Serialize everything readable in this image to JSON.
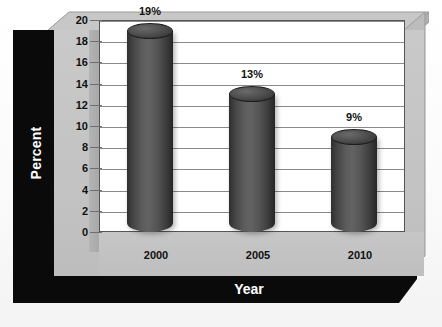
{
  "chart_data": {
    "type": "bar",
    "title": "",
    "subtitle": "",
    "xlabel": "Year",
    "ylabel": "Percent",
    "categories": [
      "2000",
      "2005",
      "2010"
    ],
    "values": [
      19,
      13,
      9
    ],
    "data_labels": [
      "19%",
      "13%",
      "9%"
    ],
    "ylim": [
      0,
      20
    ],
    "ytick_labels": [
      "0",
      "2",
      "4",
      "6",
      "8",
      "10",
      "12",
      "14",
      "16",
      "18",
      "20"
    ],
    "ytick_values": [
      0,
      2,
      4,
      6,
      8,
      10,
      12,
      14,
      16,
      18,
      20
    ],
    "grid": true,
    "grid_axis": "y",
    "legend": false,
    "legend_position": "none",
    "style": "3d-cylinder",
    "series": [
      {
        "name": "Percent",
        "values": [
          19,
          13,
          9
        ]
      }
    ],
    "colors": {
      "bar_fill": "#535353",
      "bar_edge": "#1d1d1d",
      "plot_background": "#ffffff",
      "panel_background": "#c3c3c3",
      "frame": "#0a0a0a",
      "gridline": "#8a8a8a",
      "axis_text": "#111111",
      "title_text": "#ffffff",
      "page_background": "#fbfbfb"
    }
  }
}
